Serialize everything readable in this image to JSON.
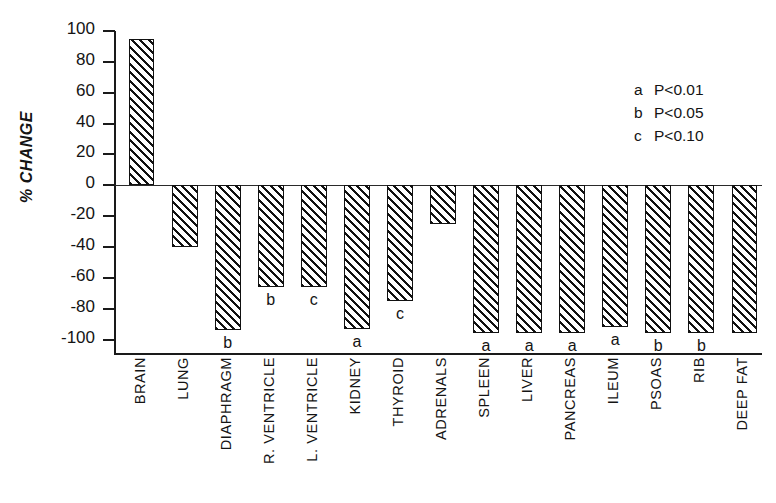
{
  "chart_data": {
    "type": "bar",
    "title": "",
    "xlabel": "",
    "ylabel": "% CHANGE",
    "ylim": [
      -110,
      100
    ],
    "yticks": [
      100,
      80,
      60,
      40,
      20,
      0,
      -20,
      -40,
      -60,
      -80,
      -100
    ],
    "ytick_labels": [
      "100",
      "80",
      "60",
      "40",
      "20",
      "0",
      "-20",
      "-40",
      "-60",
      "-80",
      "-100"
    ],
    "grid": false,
    "categories": [
      "BRAIN",
      "LUNG",
      "DIAPHRAGM",
      "R. VENTRICLE",
      "L. VENTRICLE",
      "KIDNEY",
      "THYROID",
      "ADRENALS",
      "SPLEEN",
      "LIVER",
      "PANCREAS",
      "ILEUM",
      "PSOAS",
      "RIB",
      "DEEP FAT"
    ],
    "values": [
      95,
      -40,
      -94,
      -66,
      -66,
      -93,
      -75,
      -25,
      -96,
      -96,
      -96,
      -92,
      -96,
      -96,
      -96
    ],
    "annotations": [
      "",
      "",
      "b",
      "b",
      "c",
      "a",
      "c",
      "",
      "a",
      "a",
      "a",
      "a",
      "b",
      "b",
      ""
    ],
    "legend_position": "top-right",
    "legend": [
      {
        "key": "a",
        "text": "P<0.01"
      },
      {
        "key": "b",
        "text": "P<0.05"
      },
      {
        "key": "c",
        "text": "P<0.10"
      }
    ]
  }
}
